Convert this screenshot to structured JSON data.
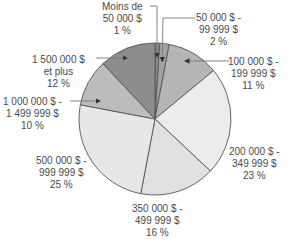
{
  "chart_data": {
    "type": "pie",
    "title": "",
    "start_angle_deg": 0,
    "direction": "clockwise",
    "slices": [
      {
        "label_lines": [
          "Moins de",
          "50 000 $",
          "1 %"
        ],
        "category": "Moins de 50 000 $",
        "value": 1,
        "color": "#8a8a8a"
      },
      {
        "label_lines": [
          "50 000 $ -",
          "99 999 $",
          "2 %"
        ],
        "category": "50 000 $ - 99 999 $",
        "value": 2,
        "color": "#a3a3a3"
      },
      {
        "label_lines": [
          "100 000 $ -",
          "199 999 $",
          "11 %"
        ],
        "category": "100 000 $ - 199 999 $",
        "value": 11,
        "color": "#b5b5b5"
      },
      {
        "label_lines": [
          "200 000 $ -",
          "349 999 $",
          "23 %"
        ],
        "category": "200 000 $ - 349 999 $",
        "value": 23,
        "color": "#ececec"
      },
      {
        "label_lines": [
          "350 000 $ -",
          "499 999 $",
          "16 %"
        ],
        "category": "350 000 $ - 499 999 $",
        "value": 16,
        "color": "#e1e1e1"
      },
      {
        "label_lines": [
          "500 000 $ -",
          "999 999 $",
          "25 %"
        ],
        "category": "500 000 $ - 999 999 $",
        "value": 25,
        "color": "#e7e7e7"
      },
      {
        "label_lines": [
          "1 000 000 $ -",
          "1 499 999 $",
          "10 %"
        ],
        "category": "1 000 000 $ - 1 499 999 $",
        "value": 10,
        "color": "#bcbcbc"
      },
      {
        "label_lines": [
          "1 500 000 $",
          "et plus",
          "12 %"
        ],
        "category": "1 500 000 $ et plus",
        "value": 12,
        "color": "#8d8d8d"
      }
    ],
    "categories": [
      "Moins de 50 000 $",
      "50 000 $ - 99 999 $",
      "100 000 $ - 199 999 $",
      "200 000 $ - 349 999 $",
      "350 000 $ - 499 999 $",
      "500 000 $ - 999 999 $",
      "1 000 000 $ - 1 499 999 $",
      "1 500 000 $ et plus"
    ],
    "values": [
      1,
      2,
      11,
      23,
      16,
      25,
      10,
      12
    ],
    "unit": "%",
    "legend": "none (callout labels)"
  },
  "style": {
    "outline_color": "#555555",
    "text_color": "#4a4a4a",
    "callout_color": "#777777"
  }
}
